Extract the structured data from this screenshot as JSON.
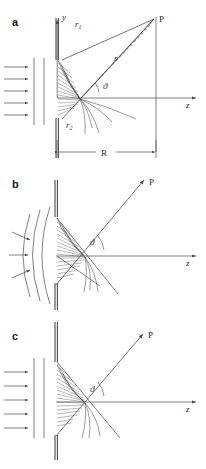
{
  "figure": {
    "stroke_color": "#4a4a4a",
    "label_color": "#2b2b2b",
    "background": "#ffffff"
  },
  "panels": [
    {
      "id": "a",
      "label": "a",
      "description": "Plane wave incident on aperture, spherical wavelets converge to point P on observation screen at finite distance R",
      "illumination": "plane-wave",
      "incident_arrow_count": 5,
      "wavefront_count": 2,
      "observation": "finite-screen",
      "labels": {
        "point": "P",
        "axis_y": "y",
        "axis_z": "z",
        "ray_top": "r",
        "ray_top_sub": "1",
        "ray_mid": "r",
        "ray_bottom": "r",
        "ray_bottom_sub": "2",
        "angle": "ϑ",
        "distance": "R"
      }
    },
    {
      "id": "b",
      "label": "b",
      "description": "Converging spherical wave incident on aperture, diffracted ray toward P",
      "illumination": "spherical-wave",
      "incident_arrow_count": 3,
      "wavefront_count": 3,
      "observation": "ray-to-P",
      "labels": {
        "point": "P",
        "axis_z": "z",
        "angle": "ϑ"
      }
    },
    {
      "id": "c",
      "label": "c",
      "description": "Plane wave incident on aperture, diffracted ray toward P at infinity (Fraunhofer case)",
      "illumination": "plane-wave",
      "incident_arrow_count": 5,
      "wavefront_count": 2,
      "observation": "ray-to-P",
      "labels": {
        "point": "P",
        "axis_z": "z",
        "angle": "ϑ"
      }
    }
  ]
}
